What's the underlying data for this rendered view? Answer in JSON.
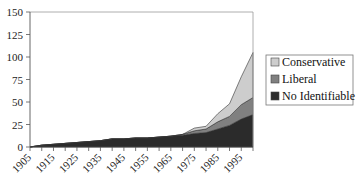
{
  "chart_data": {
    "type": "area",
    "stacked": true,
    "title": "",
    "xlabel": "",
    "ylabel": "",
    "ylim": [
      0,
      150
    ],
    "yticks": [
      0,
      25,
      50,
      75,
      100,
      125,
      150
    ],
    "xlim": [
      1905,
      2000
    ],
    "xtick_labels": [
      "1905",
      "1915",
      "1925",
      "1935",
      "1945",
      "1955",
      "1965",
      "1975",
      "1985",
      "1995"
    ],
    "grid": false,
    "legend_position": "right",
    "x": [
      1905,
      1910,
      1915,
      1920,
      1925,
      1930,
      1935,
      1940,
      1945,
      1950,
      1955,
      1960,
      1965,
      1970,
      1975,
      1980,
      1985,
      1990,
      1995,
      2000
    ],
    "series": [
      {
        "name": "No Identifiable",
        "color": "#2b2b2b",
        "values": [
          0,
          2,
          3,
          4,
          5,
          6,
          7,
          9,
          9,
          10,
          10,
          11,
          12,
          13,
          15,
          16,
          20,
          24,
          31,
          36
        ]
      },
      {
        "name": "Liberal",
        "color": "#808080",
        "values": [
          0,
          0,
          0,
          0,
          0,
          0,
          0,
          0,
          0,
          0,
          0,
          0,
          0,
          1,
          3,
          4,
          8,
          10,
          16,
          19
        ]
      },
      {
        "name": "Conservative",
        "color": "#cdcdcd",
        "values": [
          0,
          0,
          0,
          0,
          0,
          0,
          0,
          0,
          0,
          0,
          0,
          0,
          0,
          0,
          3,
          3,
          9,
          14,
          31,
          50
        ]
      }
    ]
  },
  "legend": {
    "items": [
      {
        "label": "Conservative",
        "color": "#cdcdcd"
      },
      {
        "label": "Liberal",
        "color": "#808080"
      },
      {
        "label": "No Identifiable",
        "color": "#2b2b2b"
      }
    ]
  }
}
